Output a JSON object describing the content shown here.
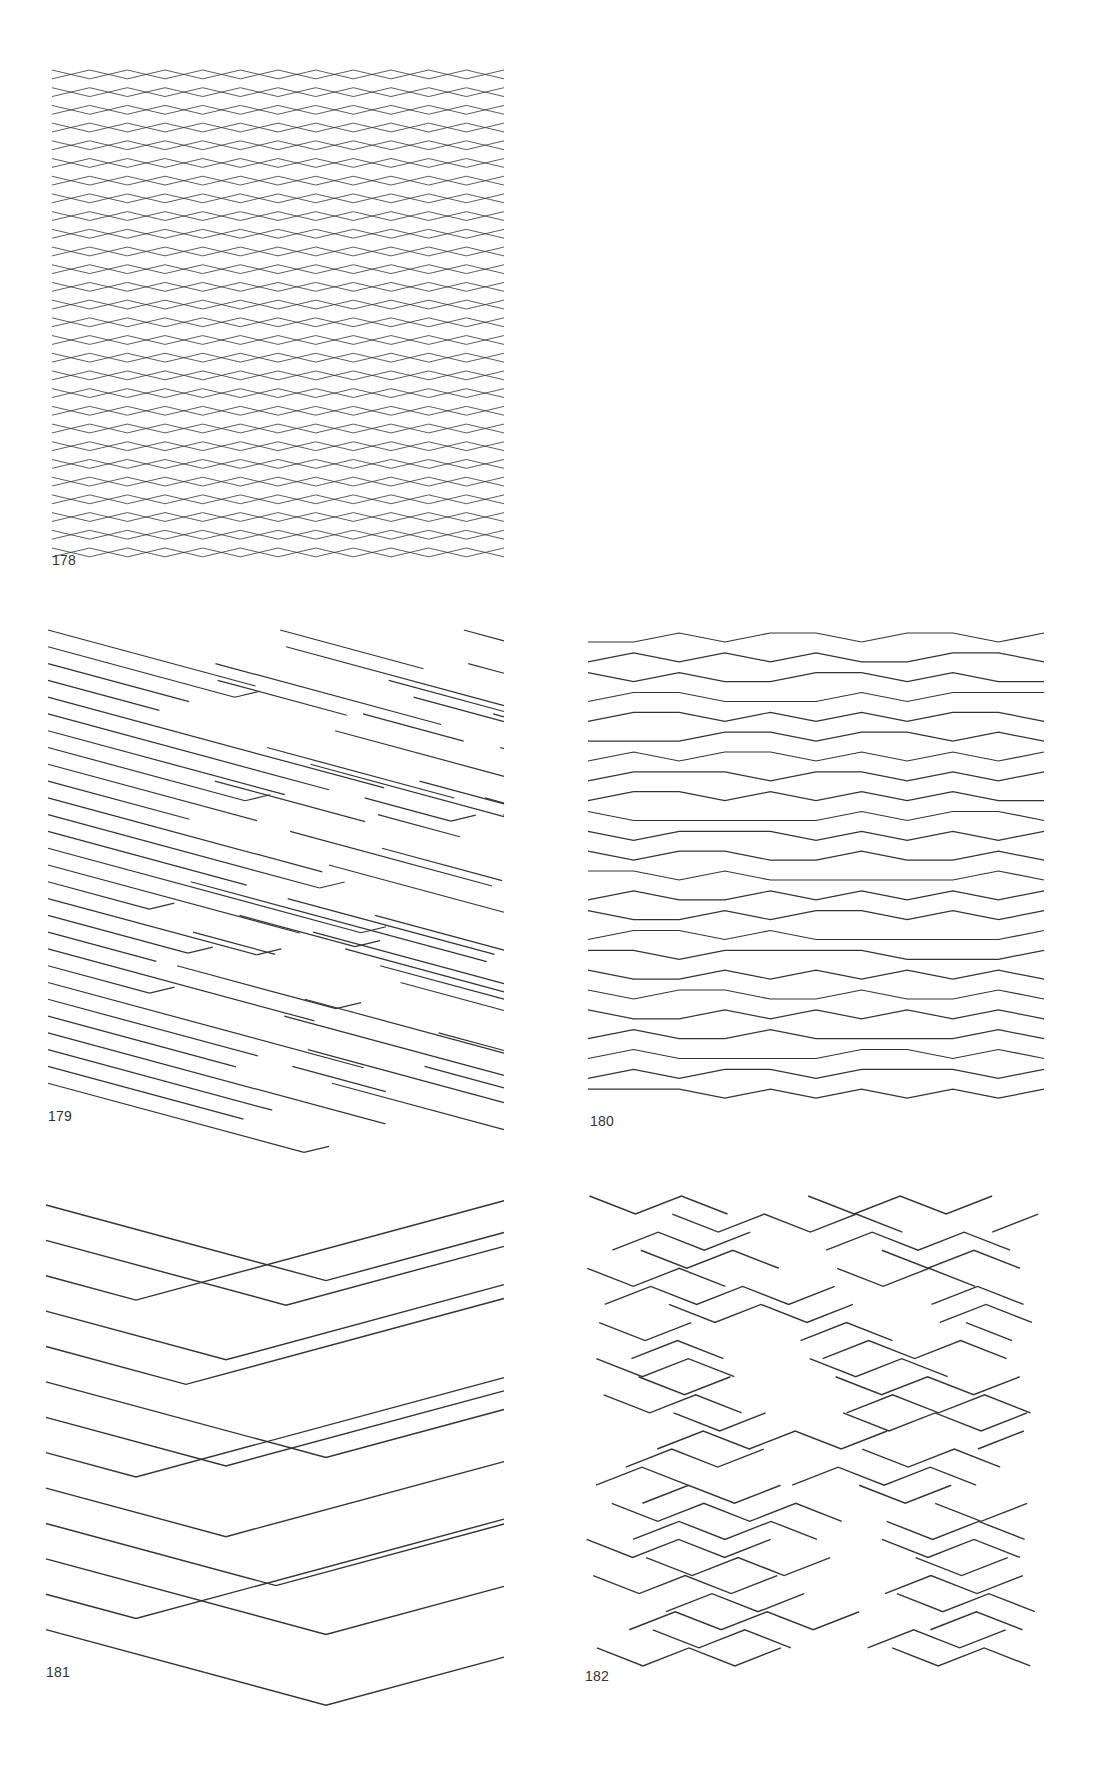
{
  "page": {
    "figures": [
      {
        "id": "178",
        "label": "178",
        "x": 52,
        "y": 70,
        "w": 452,
        "h": 478,
        "label_x": 52,
        "label_y": 552,
        "type": "lattice",
        "rows": 27,
        "cols": 6
      },
      {
        "id": "179",
        "label": "179",
        "x": 48,
        "y": 630,
        "w": 456,
        "h": 470,
        "label_x": 48,
        "label_y": 1108,
        "type": "broken-diagonals",
        "rows": 28
      },
      {
        "id": "180",
        "label": "180",
        "x": 588,
        "y": 630,
        "w": 456,
        "h": 476,
        "label_x": 590,
        "label_y": 1113,
        "type": "zigzag",
        "rows": 24
      },
      {
        "id": "181",
        "label": "181",
        "x": 46,
        "y": 1195,
        "w": 458,
        "h": 460,
        "label_x": 46,
        "label_y": 1664,
        "type": "chevrons",
        "rows": 13
      },
      {
        "id": "182",
        "label": "182",
        "x": 585,
        "y": 1195,
        "w": 460,
        "h": 470,
        "label_x": 585,
        "label_y": 1668,
        "type": "maze-zigzag",
        "rows": 26
      }
    ],
    "colors": {
      "ink": "#333333",
      "background": "#ffffff"
    }
  }
}
